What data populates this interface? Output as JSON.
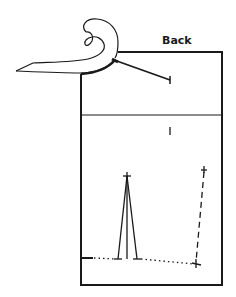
{
  "diagram": {
    "title_label": "Back",
    "mark_label": "I",
    "colors": {
      "stroke": "#1a1a1a",
      "background": "#ffffff"
    },
    "box": {
      "left": 81,
      "top": 52,
      "right": 222,
      "bottom": 285,
      "divider_y": 115
    },
    "elements": [
      {
        "name": "hook-curl",
        "type": "outline-shape"
      },
      {
        "name": "angled-arm-line",
        "from": [
          115,
          60
        ],
        "to": [
          170,
          80
        ],
        "end": "tick"
      },
      {
        "name": "peak-lines",
        "apex": [
          127,
          175
        ],
        "bases": [
          [
            118,
            259
          ],
          [
            127,
            259
          ],
          [
            137,
            259
          ]
        ]
      },
      {
        "name": "baseline-solid",
        "from": [
          82,
          258
        ],
        "to": [
          93,
          258
        ]
      },
      {
        "name": "baseline-dotted-left",
        "from": [
          93,
          258
        ],
        "to": [
          118,
          259
        ]
      },
      {
        "name": "baseline-dotted-right",
        "from": [
          137,
          259
        ],
        "to": [
          196,
          264
        ]
      },
      {
        "name": "dashed-vertical",
        "from": [
          204,
          170
        ],
        "to": [
          196,
          263
        ],
        "end": "tick"
      }
    ]
  }
}
